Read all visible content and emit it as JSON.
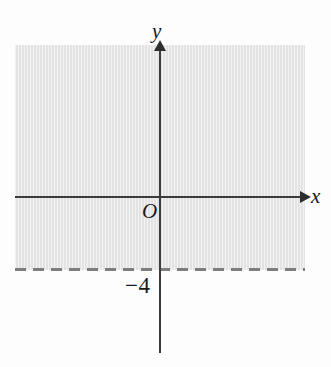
{
  "figure": {
    "axis_labels": {
      "x": "x",
      "y": "y",
      "origin": "O"
    },
    "tick_labels": {
      "y_intercept": "−4"
    },
    "colors": {
      "shading": "#e3e3e3",
      "axis": "#3b3b3b",
      "boundary_line": "#7e7e7e",
      "background": "#fdfdfd",
      "text": "#1a1a1a"
    }
  },
  "chart_data": {
    "type": "line",
    "xlabel": "x",
    "ylabel": "y",
    "xlim": [
      -8,
      8
    ],
    "ylim": [
      -8.5,
      4.5
    ],
    "grid": false,
    "legend": null,
    "annotations": [
      {
        "text": "y",
        "role": "y-axis-label"
      },
      {
        "text": "x",
        "role": "x-axis-label"
      },
      {
        "text": "O",
        "role": "origin-label"
      },
      {
        "text": "−4",
        "role": "y-intercept-tick-label",
        "value": -4
      }
    ],
    "series": [
      {
        "name": "boundary line y = -4",
        "type": "horizontal-line",
        "y": -4,
        "linestyle": "dashed",
        "color": "#7e7e7e",
        "inclusive": false
      }
    ],
    "shaded_regions": [
      {
        "name": "solution region",
        "inequality": "y > -4",
        "description": "Half-plane above the dashed line y = -4",
        "fill_color": "#e3e3e3",
        "boundary_included": false
      }
    ]
  }
}
